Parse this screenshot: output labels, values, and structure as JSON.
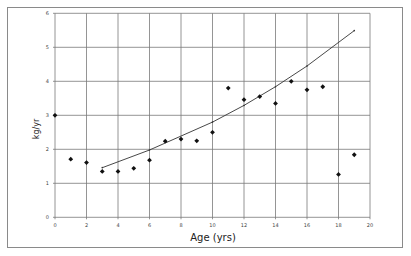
{
  "chart_data": {
    "type": "scatter",
    "title": "",
    "xlabel": "Age (yrs)",
    "ylabel": "kg/yr",
    "xlim": [
      0,
      20
    ],
    "ylim": [
      0,
      6
    ],
    "grid": true,
    "legend": "none",
    "x_ticks": [
      "0",
      "2",
      "4",
      "6",
      "8",
      "10",
      "12",
      "14",
      "16",
      "18",
      "20"
    ],
    "y_ticks": [
      "0",
      "1",
      "2",
      "3",
      "4",
      "5",
      "6"
    ],
    "series": [
      {
        "name": "observed",
        "marker": "diamond",
        "x": [
          0,
          1,
          2,
          3,
          4,
          5,
          6,
          7,
          8,
          9,
          10,
          11,
          12,
          13,
          14,
          15,
          16,
          17,
          18,
          19
        ],
        "values": [
          3.0,
          1.71,
          1.61,
          1.35,
          1.35,
          1.44,
          1.68,
          2.24,
          2.3,
          2.25,
          2.5,
          3.8,
          3.46,
          3.55,
          3.35,
          4.0,
          3.75,
          3.84,
          1.26,
          1.84
        ]
      },
      {
        "name": "trend",
        "type": "line",
        "x": [
          3,
          6,
          10,
          12,
          14,
          16,
          19
        ],
        "values": [
          1.46,
          1.98,
          2.8,
          3.29,
          3.84,
          4.45,
          5.49
        ]
      }
    ]
  }
}
